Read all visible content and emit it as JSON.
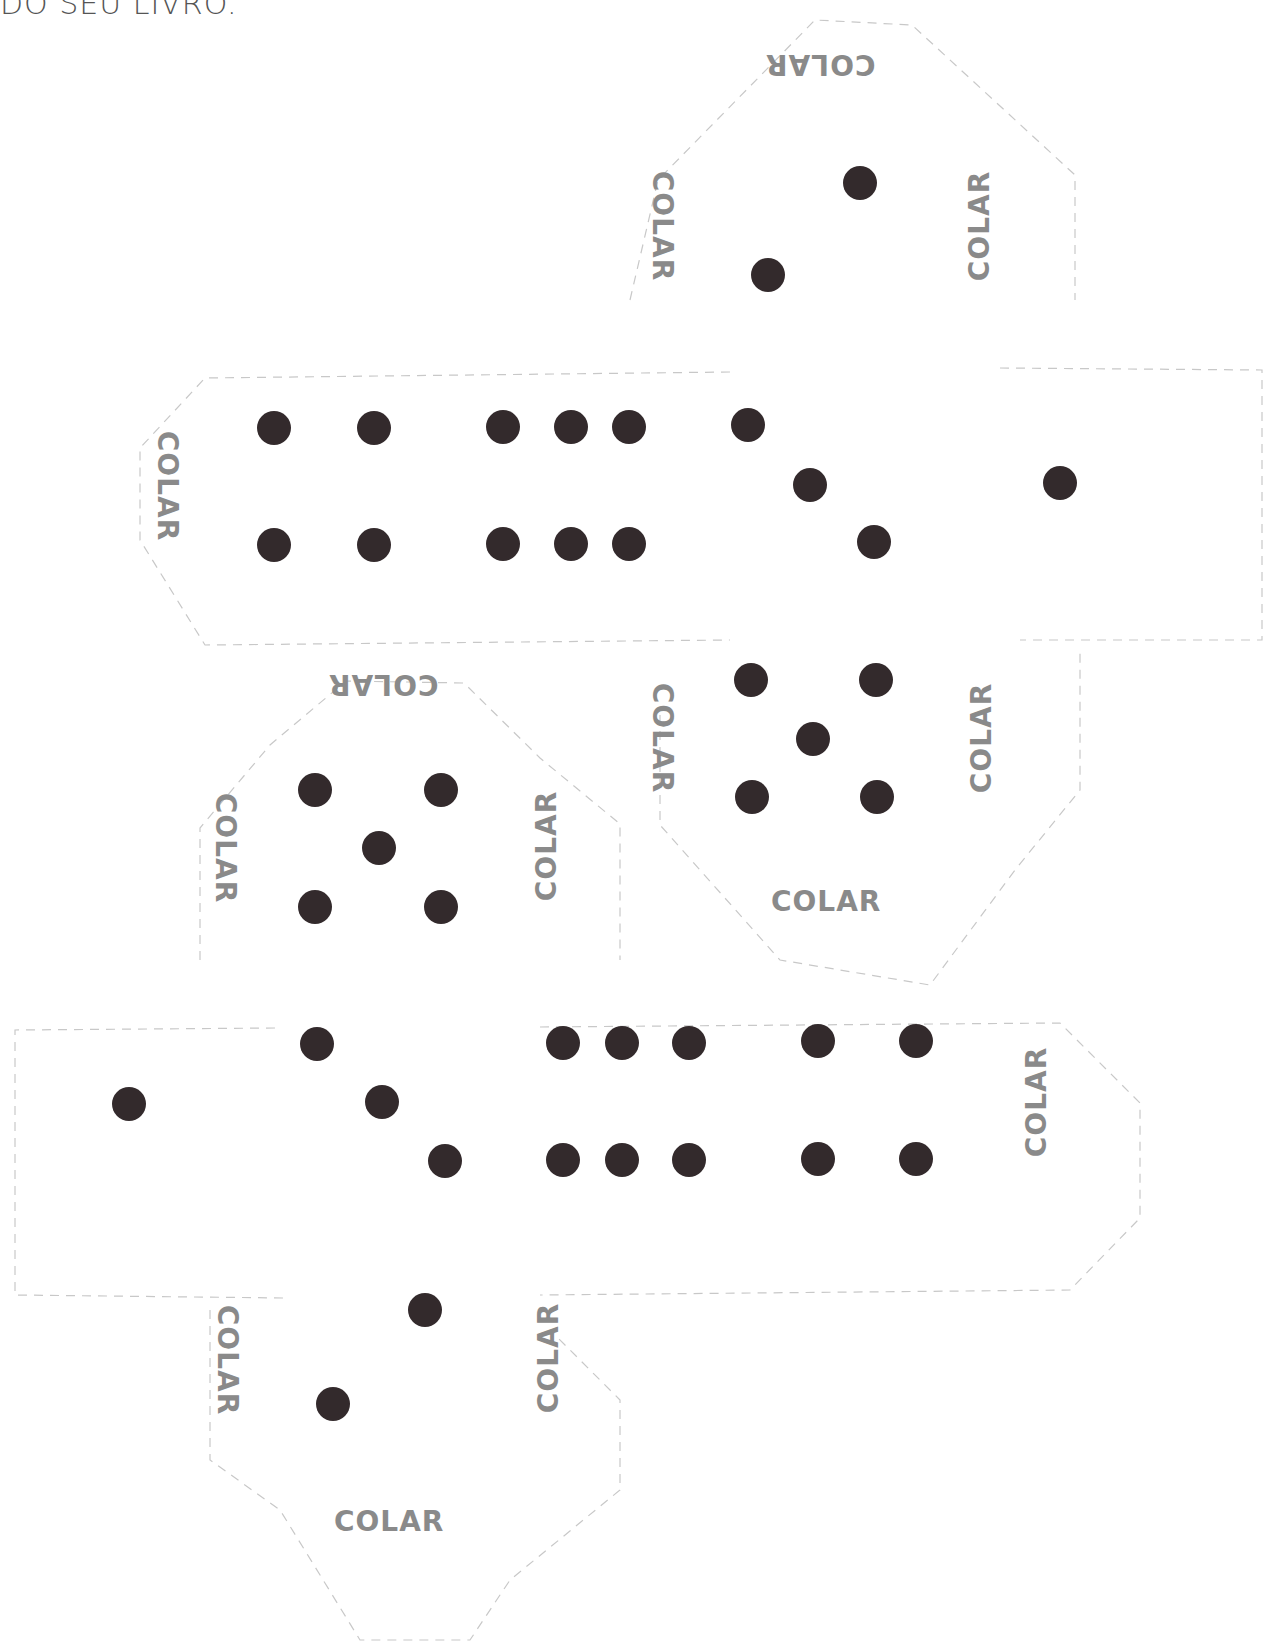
{
  "header": {
    "text": "DO SEU LIVRO."
  },
  "colors": {
    "pip": "#332a2c",
    "label": "#8a8a8a",
    "outline": "#c8c8c8",
    "background": "#ffffff"
  },
  "glue_label": "COLAR",
  "template": {
    "pieces": [
      {
        "id": "top-tab-face",
        "face_value": 2,
        "labels": [
          "COLAR",
          "COLAR",
          "COLAR"
        ]
      },
      {
        "id": "strip-1",
        "faces": [
          2,
          6,
          3,
          1
        ],
        "labels": [
          "COLAR"
        ]
      },
      {
        "id": "middle-left-face",
        "face_value": 5,
        "labels": [
          "COLAR",
          "COLAR",
          "COLAR"
        ]
      },
      {
        "id": "middle-right-face",
        "face_value": 5,
        "labels": [
          "COLAR",
          "COLAR",
          "COLAR"
        ]
      },
      {
        "id": "strip-2",
        "faces": [
          1,
          3,
          6,
          2
        ],
        "labels": [
          "COLAR"
        ]
      },
      {
        "id": "bottom-tab-face",
        "face_value": 2,
        "labels": [
          "COLAR",
          "COLAR",
          "COLAR"
        ]
      }
    ]
  },
  "labels": {
    "top_tab_top": "COLAR",
    "top_tab_left": "COLAR",
    "top_tab_right": "COLAR",
    "strip1_left": "COLAR",
    "mid_left_top": "COLAR",
    "mid_left_left": "COLAR",
    "mid_left_right": "COLAR",
    "mid_right_left": "COLAR",
    "mid_right_right": "COLAR",
    "mid_right_bottom": "COLAR",
    "strip2_right": "COLAR",
    "bottom_tab_left": "COLAR",
    "bottom_tab_right": "COLAR",
    "bottom_tab_bottom": "COLAR"
  }
}
